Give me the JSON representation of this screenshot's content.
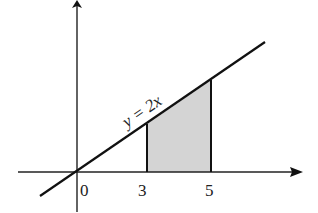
{
  "diagram": {
    "type": "area-under-line",
    "line_label": "y = 2x",
    "x_ticks": [
      {
        "label": "0",
        "value": 0
      },
      {
        "label": "3",
        "value": 3
      },
      {
        "label": "5",
        "value": 5
      }
    ],
    "shaded_region": {
      "from": 3,
      "to": 5,
      "color": "#d4d4d4"
    },
    "line_color": "#111111",
    "axis_color": "#111111"
  }
}
